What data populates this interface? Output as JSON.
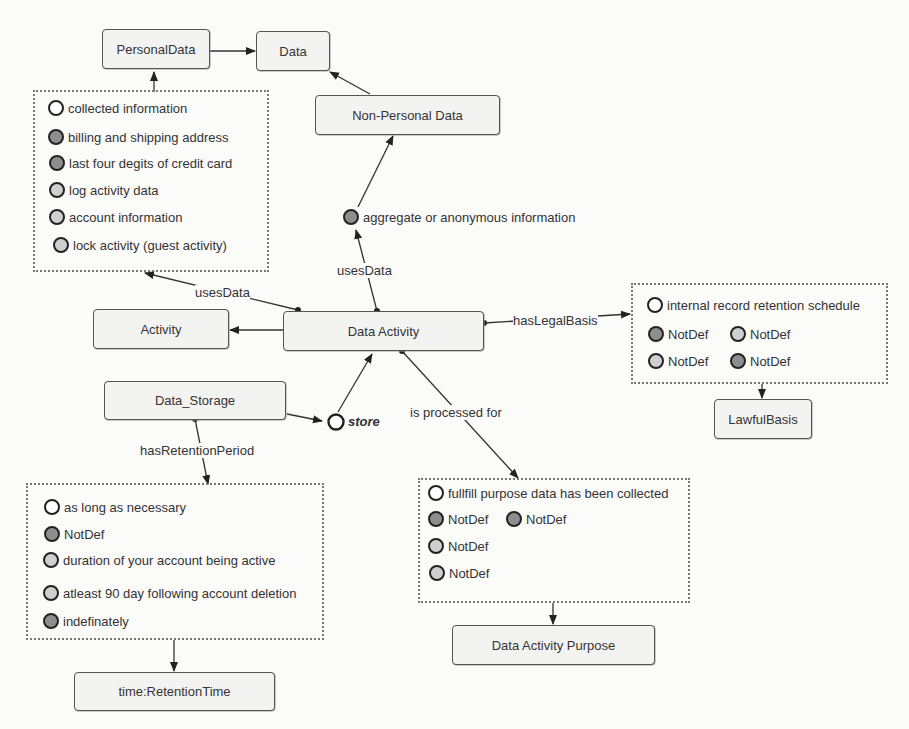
{
  "nodes": {
    "personal_data": "PersonalData",
    "data": "Data",
    "non_personal_data": "Non-Personal Data",
    "activity": "Activity",
    "data_activity": "Data Activity",
    "data_storage": "Data_Storage",
    "lawful_basis": "LawfulBasis",
    "retention_time": "time:RetentionTime",
    "data_activity_purpose": "Data Activity Purpose"
  },
  "edge_labels": {
    "uses_data_left": "usesData",
    "uses_data_top": "usesData",
    "has_legal_basis": "hasLegalBasis",
    "is_processed_for": "is processed for",
    "has_retention_period": "hasRetentionPeriod",
    "store": "store"
  },
  "personal_data_items": [
    {
      "label": "collected information",
      "fill": "white"
    },
    {
      "label": "billing and shipping address",
      "fill": "dark"
    },
    {
      "label": "last four degits of credit card",
      "fill": "dark"
    },
    {
      "label": "log activity data",
      "fill": "light"
    },
    {
      "label": "account information",
      "fill": "light"
    },
    {
      "label": "lock activity (guest activity)",
      "fill": "light"
    }
  ],
  "non_personal_item": {
    "label": "aggregate or anonymous information",
    "fill": "dark"
  },
  "legal_basis_items": [
    {
      "label": "internal record retention schedule",
      "fill": "white"
    },
    {
      "label": "NotDef",
      "fill": "dark"
    },
    {
      "label": "NotDef",
      "fill": "light"
    },
    {
      "label": "NotDef",
      "fill": "light"
    },
    {
      "label": "NotDef",
      "fill": "dark"
    }
  ],
  "retention_items": [
    {
      "label": "as long as necessary",
      "fill": "white"
    },
    {
      "label": "NotDef",
      "fill": "dark"
    },
    {
      "label": "duration of your account being active",
      "fill": "light"
    },
    {
      "label": "atleast 90 day following account deletion",
      "fill": "light"
    },
    {
      "label": "indefinately",
      "fill": "dark"
    }
  ],
  "purpose_items": [
    {
      "label": "fullfill purpose data has been collected",
      "fill": "white"
    },
    {
      "label": "NotDef",
      "fill": "dark"
    },
    {
      "label": "NotDef",
      "fill": "dark"
    },
    {
      "label": "NotDef",
      "fill": "light"
    },
    {
      "label": "NotDef",
      "fill": "light"
    }
  ],
  "colors": {
    "dark_fill": "#8e8e8e",
    "light_fill": "#cfcfcf",
    "white_fill": "#ffffff",
    "node_bg": "#f3f3f2",
    "stroke": "#333333"
  }
}
